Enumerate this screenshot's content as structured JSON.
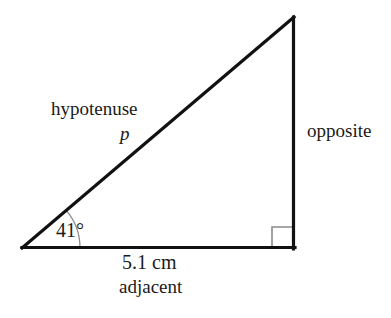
{
  "figure": {
    "type": "right-triangle-trigonometry-diagram",
    "background_color": "#ffffff",
    "line_color": "#111111",
    "marker_color": "#8a8a8a",
    "text_color": "#1a1a1a",
    "vertices": {
      "left": [
        22,
        248
      ],
      "apex": [
        294,
        17
      ],
      "right": [
        294,
        249
      ]
    },
    "labels": {
      "hypotenuse": "hypotenuse",
      "hypotenuse_variable": "p",
      "opposite": "opposite",
      "angle": "41°",
      "base_length": "5.1 cm",
      "adjacent": "adjacent"
    },
    "angle_arc": {
      "vertex": [
        22,
        248
      ],
      "radius": 58,
      "start_degrees": 0,
      "end_degrees": 41
    },
    "right_angle_marker": {
      "at": [
        294,
        249
      ],
      "size": 22
    }
  },
  "chart_data": {
    "type": "diagram",
    "shape": "right triangle",
    "measurements": [
      {
        "name": "angle",
        "value": 41,
        "unit": "degrees",
        "label": "41°"
      },
      {
        "name": "adjacent",
        "value": 5.1,
        "unit": "cm",
        "label": "5.1 cm"
      },
      {
        "name": "hypotenuse",
        "value": "p",
        "unit": "",
        "label": "p"
      },
      {
        "name": "opposite",
        "value": "",
        "unit": "",
        "label": "opposite"
      }
    ],
    "side_names": [
      "hypotenuse",
      "opposite",
      "adjacent"
    ],
    "annotations": [
      "hypotenuse",
      "p",
      "opposite",
      "41°",
      "5.1 cm",
      "adjacent"
    ]
  }
}
